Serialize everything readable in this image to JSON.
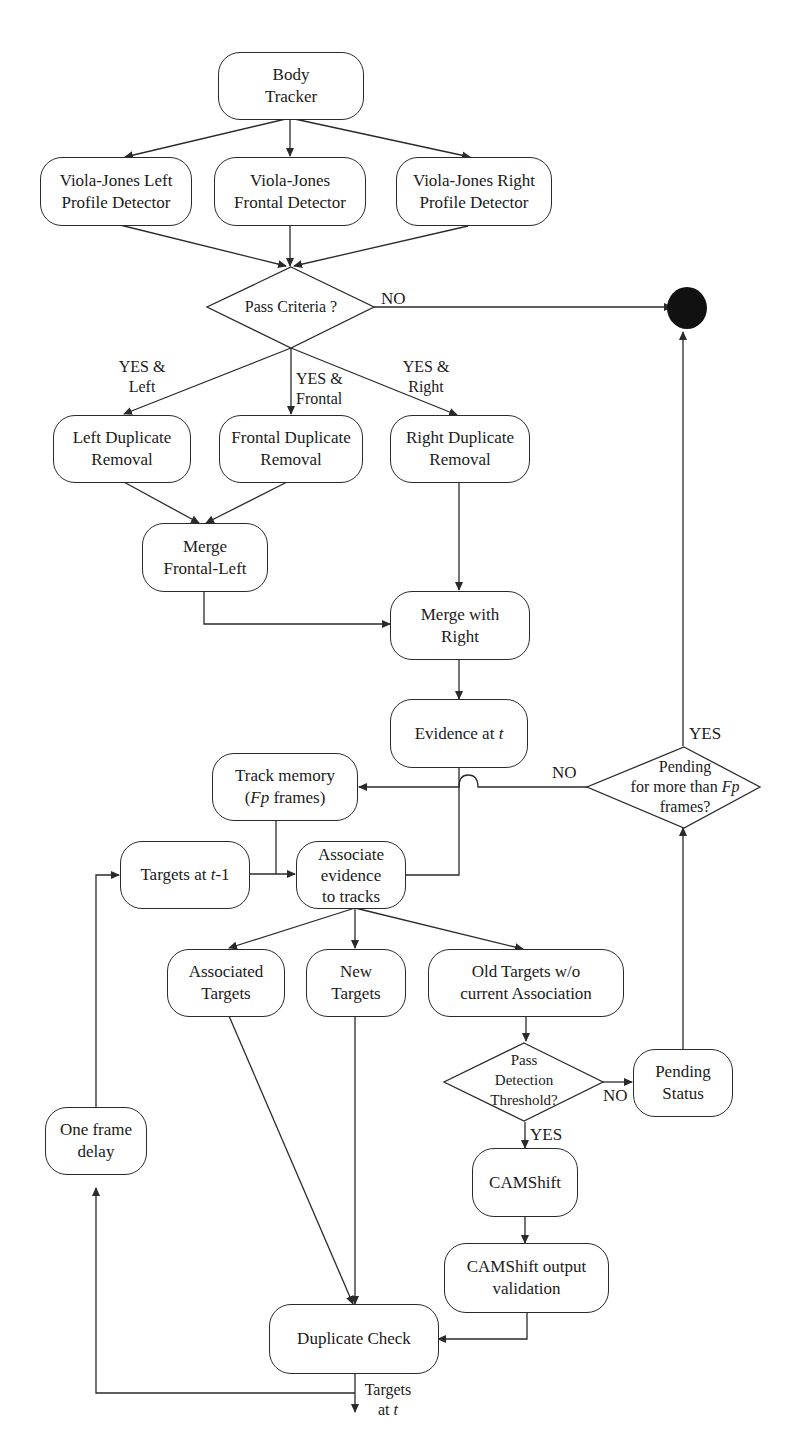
{
  "diagram": {
    "type": "flowchart",
    "nodes": {
      "body_tracker": {
        "line1": "Body",
        "line2": "Tracker"
      },
      "vj_left": {
        "line1": "Viola-Jones Left",
        "line2": "Profile Detector"
      },
      "vj_frontal": {
        "line1": "Viola-Jones",
        "line2": "Frontal Detector"
      },
      "vj_right": {
        "line1": "Viola-Jones Right",
        "line2": "Profile Detector"
      },
      "pass_criteria": {
        "text": "Pass Criteria ?"
      },
      "left_dup": {
        "line1": "Left Duplicate",
        "line2": "Removal"
      },
      "frontal_dup": {
        "line1": "Frontal Duplicate",
        "line2": "Removal"
      },
      "right_dup": {
        "line1": "Right Duplicate",
        "line2": "Removal"
      },
      "merge_fl": {
        "line1": "Merge",
        "line2": "Frontal-Left"
      },
      "merge_right": {
        "line1": "Merge with",
        "line2": "Right"
      },
      "evidence": {
        "prefix": "Evidence at ",
        "var": "t"
      },
      "track_memory": {
        "line1": "Track memory",
        "line2_open": "(",
        "line2_var": "Fp",
        "line2_rest": " frames)"
      },
      "targets_prev": {
        "prefix": "Targets at ",
        "var": "t",
        "suffix": "-1"
      },
      "associate": {
        "line1": "Associate",
        "line2": "evidence",
        "line3": "to tracks"
      },
      "associated_targets": {
        "line1": "Associated",
        "line2": "Targets"
      },
      "new_targets": {
        "line1": "New",
        "line2": "Targets"
      },
      "old_targets": {
        "line1": "Old Targets w/o",
        "line2": "current Association"
      },
      "pass_detection": {
        "line1": "Pass",
        "line2": "Detection",
        "line3": "Threshold?"
      },
      "pending_status": {
        "line1": "Pending",
        "line2": "Status"
      },
      "pending_frames": {
        "line1": "Pending",
        "line2_prefix": "for more than ",
        "line2_var": "Fp",
        "line3": "frames?"
      },
      "camshift": {
        "text": "CAMShift"
      },
      "camshift_validation": {
        "line1": "CAMShift output",
        "line2": "validation"
      },
      "duplicate_check": {
        "text": "Duplicate Check"
      },
      "one_frame_delay": {
        "line1": "One frame",
        "line2": "delay"
      }
    },
    "edge_labels": {
      "no_criteria": "NO",
      "yes_left": {
        "line1": "YES &",
        "line2": "Left"
      },
      "yes_frontal": {
        "line1": "YES &",
        "line2": "Frontal"
      },
      "yes_right": {
        "line1": "YES &",
        "line2": "Right"
      },
      "pending_yes": "YES",
      "pending_no": "NO",
      "detection_no": "NO",
      "detection_yes": "YES",
      "output": {
        "line1": "Targets",
        "line2_prefix": "at ",
        "line2_var": "t"
      }
    },
    "colors": {
      "stroke": "#2a2a2a",
      "terminal": "#111111",
      "background": "#ffffff"
    }
  }
}
